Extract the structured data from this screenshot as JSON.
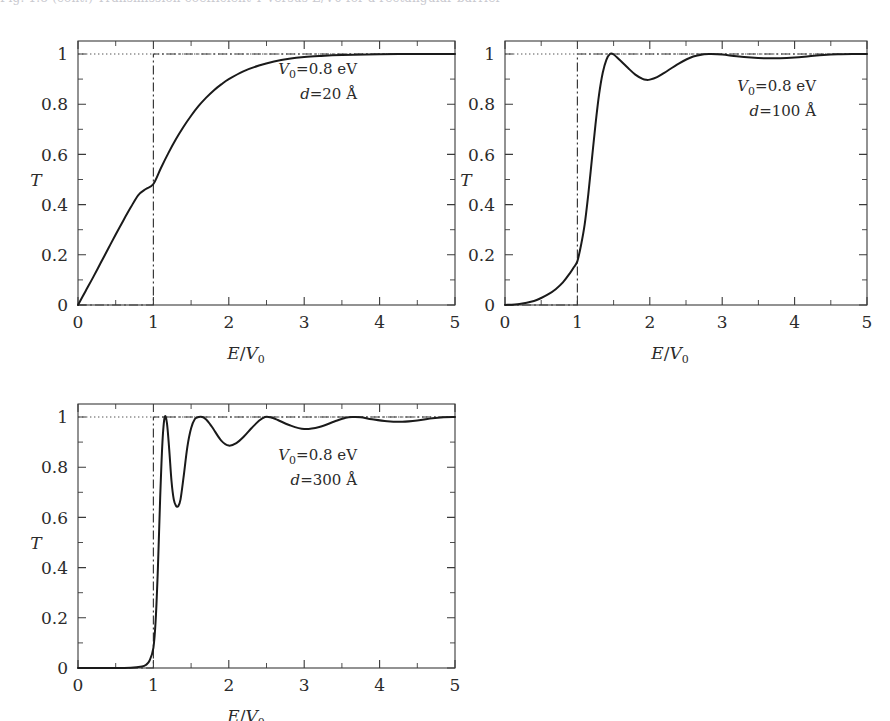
{
  "figure": {
    "truncated_caption": "Fig. 1.8 (cont.)  Transmission coefficient T versus E/V0 for a rectangular barrier",
    "panels": [
      {
        "id": "panel-a",
        "annotation_line1": "V₀=0.8 eV",
        "annotation_line2": "d=20 Å",
        "V0_symbol": "V",
        "V0_sub": "0",
        "V0_value": "=0.8 eV",
        "d_symbol": "d",
        "d_value": "=20 Å",
        "ylabel": "T",
        "xlabel_num": "E",
        "xlabel_den": "V",
        "xlabel_den_sub": "0"
      },
      {
        "id": "panel-b",
        "annotation_line1": "V₀=0.8 eV",
        "annotation_line2": "d=100 Å",
        "V0_symbol": "V",
        "V0_sub": "0",
        "V0_value": "=0.8 eV",
        "d_symbol": "d",
        "d_value": "=100 Å",
        "ylabel": "T",
        "xlabel_num": "E",
        "xlabel_den": "V",
        "xlabel_den_sub": "0"
      },
      {
        "id": "panel-c",
        "annotation_line1": "V₀=0.8 eV",
        "annotation_line2": "d=300 Å",
        "V0_symbol": "V",
        "V0_sub": "0",
        "V0_value": "=0.8 eV",
        "d_symbol": "d",
        "d_value": "=300 Å",
        "ylabel": "T",
        "xlabel_num": "E",
        "xlabel_den": "V",
        "xlabel_den_sub": "0"
      }
    ],
    "xticks": [
      "0",
      "1",
      "2",
      "3",
      "4",
      "5"
    ],
    "yticks": [
      "0",
      "0.2",
      "0.4",
      "0.6",
      "0.8",
      "1"
    ],
    "colors": {
      "curve": "#1a1a1a",
      "classical": "#3a3a3a",
      "unity": "#555555",
      "frame": "#3a3a3a",
      "text": "#2b2b2b",
      "background": "#ffffff"
    }
  },
  "chart_data": [
    {
      "type": "line",
      "title": "",
      "panel": "a",
      "xlabel": "E/V0",
      "ylabel": "T",
      "xlim": [
        0,
        5
      ],
      "ylim": [
        0,
        1.05
      ],
      "xticks": [
        0,
        1,
        2,
        3,
        4,
        5
      ],
      "yticks": [
        0,
        0.2,
        0.4,
        0.6,
        0.8,
        1
      ],
      "grid": false,
      "legend": "none",
      "annotations": [
        "V0=0.8 eV",
        "d=20 A"
      ],
      "series": [
        {
          "name": "T quantum (d=20 A)",
          "x": [
            0.0,
            0.1,
            0.2,
            0.3,
            0.4,
            0.5,
            0.6,
            0.7,
            0.8,
            0.9,
            1.0,
            1.1,
            1.2,
            1.3,
            1.4,
            1.5,
            1.6,
            1.7,
            1.8,
            1.9,
            2.0,
            2.2,
            2.4,
            2.6,
            2.8,
            3.0,
            3.2,
            3.5,
            4.0,
            4.5,
            5.0
          ],
          "y": [
            0.0,
            0.055,
            0.11,
            0.167,
            0.224,
            0.281,
            0.336,
            0.389,
            0.438,
            0.462,
            0.482,
            0.546,
            0.606,
            0.661,
            0.71,
            0.754,
            0.793,
            0.826,
            0.855,
            0.879,
            0.9,
            0.932,
            0.954,
            0.97,
            0.981,
            0.988,
            0.992,
            0.996,
            0.999,
            1.0,
            1.0
          ]
        },
        {
          "name": "T classical",
          "x": [
            0.0,
            0.999,
            1.0,
            5.0
          ],
          "y": [
            0.0,
            0.0,
            1.0,
            1.0
          ]
        },
        {
          "name": "unity reference",
          "x": [
            0.0,
            5.0
          ],
          "y": [
            1.0,
            1.0
          ]
        }
      ]
    },
    {
      "type": "line",
      "title": "",
      "panel": "b",
      "xlabel": "E/V0",
      "ylabel": "T",
      "xlim": [
        0,
        5
      ],
      "ylim": [
        0,
        1.05
      ],
      "xticks": [
        0,
        1,
        2,
        3,
        4,
        5
      ],
      "yticks": [
        0,
        0.2,
        0.4,
        0.6,
        0.8,
        1
      ],
      "grid": false,
      "legend": "none",
      "annotations": [
        "V0=0.8 eV",
        "d=100 A"
      ],
      "series": [
        {
          "name": "T quantum (d=100 A)",
          "x": [
            0.0,
            0.2,
            0.4,
            0.5,
            0.6,
            0.7,
            0.8,
            0.9,
            0.95,
            1.0,
            1.05,
            1.1,
            1.15,
            1.2,
            1.25,
            1.3,
            1.35,
            1.4,
            1.45,
            1.5,
            1.6,
            1.7,
            1.8,
            1.9,
            1.95,
            2.0,
            2.1,
            2.2,
            2.4,
            2.6,
            2.75,
            2.85,
            3.0,
            3.2,
            3.4,
            3.6,
            3.8,
            4.0,
            4.2,
            4.4,
            4.6,
            4.8,
            5.0
          ],
          "y": [
            0.0,
            0.004,
            0.016,
            0.028,
            0.043,
            0.063,
            0.09,
            0.128,
            0.15,
            0.175,
            0.238,
            0.32,
            0.44,
            0.58,
            0.72,
            0.84,
            0.925,
            0.977,
            1.0,
            0.998,
            0.972,
            0.944,
            0.918,
            0.901,
            0.897,
            0.898,
            0.908,
            0.925,
            0.962,
            0.99,
            0.999,
            1.0,
            0.998,
            0.991,
            0.986,
            0.983,
            0.983,
            0.986,
            0.991,
            0.996,
            0.999,
            1.0,
            1.0
          ]
        },
        {
          "name": "T classical",
          "x": [
            0.0,
            0.999,
            1.0,
            5.0
          ],
          "y": [
            0.0,
            0.0,
            1.0,
            1.0
          ]
        },
        {
          "name": "unity reference",
          "x": [
            0.0,
            5.0
          ],
          "y": [
            1.0,
            1.0
          ]
        }
      ]
    },
    {
      "type": "line",
      "title": "",
      "panel": "c",
      "xlabel": "E/V0",
      "ylabel": "T",
      "xlim": [
        0,
        5
      ],
      "ylim": [
        0,
        1.05
      ],
      "xticks": [
        0,
        1,
        2,
        3,
        4,
        5
      ],
      "yticks": [
        0,
        0.2,
        0.4,
        0.6,
        0.8,
        1
      ],
      "grid": false,
      "legend": "none",
      "annotations": [
        "V0=0.8 eV",
        "d=300 A"
      ],
      "series": [
        {
          "name": "T quantum (d=300 A)",
          "x": [
            0.0,
            0.4,
            0.7,
            0.85,
            0.9,
            0.95,
            1.0,
            1.03,
            1.06,
            1.09,
            1.12,
            1.15,
            1.18,
            1.21,
            1.24,
            1.27,
            1.3,
            1.33,
            1.36,
            1.4,
            1.45,
            1.5,
            1.55,
            1.6,
            1.65,
            1.7,
            1.75,
            1.8,
            1.9,
            2.0,
            2.1,
            2.2,
            2.3,
            2.4,
            2.48,
            2.55,
            2.65,
            2.8,
            3.0,
            3.2,
            3.4,
            3.55,
            3.65,
            3.75,
            3.9,
            4.1,
            4.3,
            4.5,
            4.7,
            4.85,
            5.0
          ],
          "y": [
            0.0,
            0.0,
            0.001,
            0.006,
            0.012,
            0.03,
            0.08,
            0.19,
            0.4,
            0.68,
            0.9,
            1.0,
            0.975,
            0.87,
            0.745,
            0.672,
            0.646,
            0.645,
            0.672,
            0.76,
            0.88,
            0.955,
            0.992,
            1.0,
            1.0,
            0.99,
            0.972,
            0.95,
            0.906,
            0.886,
            0.896,
            0.922,
            0.955,
            0.985,
            1.0,
            0.999,
            0.988,
            0.968,
            0.952,
            0.96,
            0.982,
            0.997,
            1.0,
            0.999,
            0.991,
            0.983,
            0.981,
            0.986,
            0.995,
            0.999,
            1.0
          ]
        },
        {
          "name": "T classical",
          "x": [
            0.0,
            0.999,
            1.0,
            5.0
          ],
          "y": [
            0.0,
            0.0,
            1.0,
            1.0
          ]
        },
        {
          "name": "unity reference",
          "x": [
            0.0,
            5.0
          ],
          "y": [
            1.0,
            1.0
          ]
        }
      ]
    }
  ]
}
